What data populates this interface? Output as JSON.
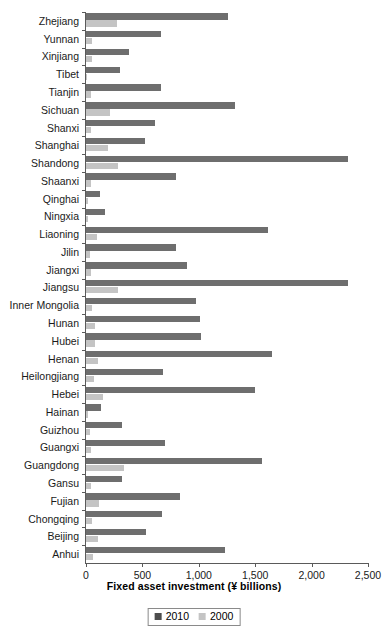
{
  "chart_data": {
    "type": "bar",
    "orientation": "horizontal",
    "title": "",
    "xlabel": "Fixed asset investment (¥ billions)",
    "ylabel": "",
    "xlim": [
      0,
      2500
    ],
    "xticks": [
      0,
      500,
      1000,
      1500,
      2000,
      2500
    ],
    "xtick_labels": [
      "0",
      "500",
      "1,000",
      "1,500",
      "2,000",
      "2,500"
    ],
    "grid": false,
    "legend_position": "bottom-center",
    "legend": [
      "2010",
      "2000"
    ],
    "colors": {
      "series_2010": "#6e6e6e",
      "series_2000": "#c4c4c4",
      "axis": "#5a5a5a",
      "text": "#1a1a1a"
    },
    "categories": [
      "Zhejiang",
      "Yunnan",
      "Xinjiang",
      "Tibet",
      "Tianjin",
      "Sichuan",
      "Shanxi",
      "Shanghai",
      "Shandong",
      "Shaanxi",
      "Qinghai",
      "Ningxia",
      "Liaoning",
      "Jilin",
      "Jiangxi",
      "Jiangsu",
      "Inner Mongolia",
      "Hunan",
      "Hubei",
      "Henan",
      "Heilongjiang",
      "Hebei",
      "Hainan",
      "Guizhou",
      "Guangxi",
      "Guangdong",
      "Gansu",
      "Fujian",
      "Chongqing",
      "Beijing",
      "Anhui"
    ],
    "series": [
      {
        "name": "2010",
        "color": "#6e6e6e",
        "values": [
          1260,
          665,
          380,
          300,
          665,
          1325,
          615,
          520,
          2325,
          800,
          125,
          170,
          1615,
          800,
          895,
          2320,
          975,
          1010,
          1020,
          1650,
          680,
          1500,
          130,
          320,
          700,
          1560,
          320,
          835,
          675,
          530,
          1230
        ]
      },
      {
        "name": "2000",
        "color": "#c4c4c4",
        "values": [
          275,
          55,
          50,
          10,
          45,
          215,
          40,
          195,
          285,
          45,
          15,
          15,
          100,
          35,
          45,
          285,
          55,
          80,
          80,
          105,
          70,
          150,
          15,
          35,
          45,
          335,
          40,
          115,
          50,
          105,
          60
        ]
      }
    ]
  }
}
